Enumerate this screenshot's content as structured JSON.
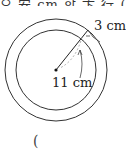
{
  "header": {
    "partial_text": "으 安 cm 합 卞 行 ("
  },
  "diagram": {
    "type": "concentric-circles",
    "outer_radius_label": "3 cm",
    "inner_radius_label": "11 cm",
    "stroke_color": "#333333"
  },
  "footer": {
    "paren": "("
  }
}
